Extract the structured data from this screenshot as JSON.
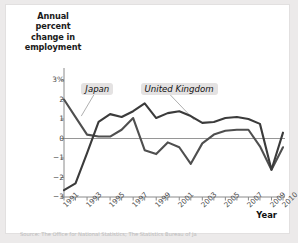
{
  "figure": {
    "y_axis_title": "Annual percent change in employment",
    "x_axis_title": "Year",
    "source_note": "Source: The Office for National Statistics; The Statistics Bureau of Ja"
  },
  "chart_data": {
    "type": "line",
    "title": "",
    "xlabel": "Year",
    "ylabel": "Annual percent change in employment",
    "x": [
      1991,
      1992,
      1993,
      1994,
      1995,
      1996,
      1997,
      1998,
      1999,
      2000,
      2001,
      2002,
      2003,
      2004,
      2005,
      2006,
      2007,
      2008,
      2009,
      2010
    ],
    "xlim": [
      1991,
      2010
    ],
    "ylim": [
      -3,
      3
    ],
    "yticks": [
      3,
      2,
      1,
      0,
      -1,
      -2,
      -3
    ],
    "ytick_labels": [
      "3%",
      "2",
      "1",
      "0",
      "-1",
      "-2",
      "-3"
    ],
    "xtick_labels": [
      "1991",
      "1993",
      "1995",
      "1997",
      "1999",
      "2001",
      "2003",
      "2005",
      "2007",
      "2009",
      "2010"
    ],
    "grid": false,
    "legend": "inline-annotations",
    "series": [
      {
        "name": "Japan",
        "color": "#4f4f4f",
        "values": [
          2.0,
          1.1,
          0.2,
          0.1,
          0.1,
          0.45,
          1.05,
          -0.6,
          -0.8,
          -0.2,
          -0.45,
          -1.3,
          -0.25,
          0.2,
          0.4,
          0.45,
          0.45,
          -0.4,
          -1.6,
          -0.45
        ]
      },
      {
        "name": "United Kingdom",
        "color": "#3b3b3b",
        "values": [
          -2.65,
          -2.3,
          -0.75,
          0.85,
          1.25,
          1.1,
          1.4,
          1.8,
          1.05,
          1.3,
          1.4,
          1.15,
          0.8,
          0.85,
          1.05,
          1.1,
          1.0,
          0.75,
          -1.6,
          0.3
        ]
      }
    ],
    "annotations": [
      {
        "label": "Japan",
        "x": 1993.2,
        "y": 2.55
      },
      {
        "label": "United Kingdom",
        "x": 1999.9,
        "y": 2.55
      }
    ]
  }
}
